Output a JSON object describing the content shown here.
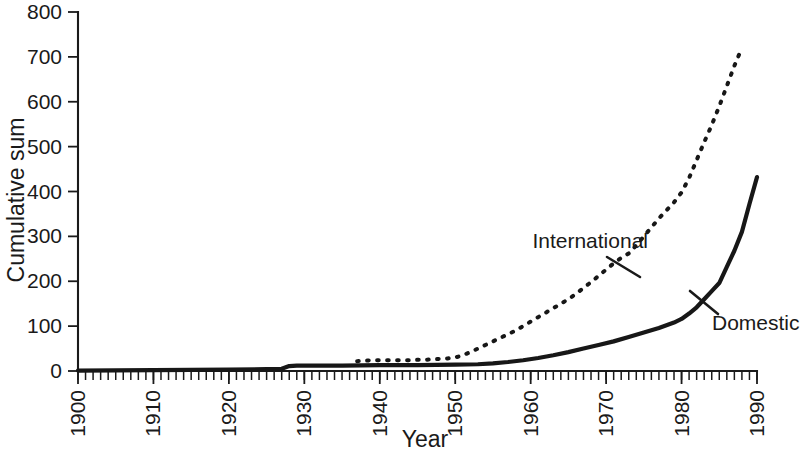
{
  "chart_data": {
    "type": "line",
    "title": "",
    "xlabel": "Year",
    "ylabel": "Cumulative sum",
    "xlim": [
      1900,
      1990
    ],
    "ylim": [
      0,
      800
    ],
    "grid": false,
    "legend_position": "inline-annotations",
    "x_ticks": [
      1900,
      1910,
      1920,
      1930,
      1940,
      1950,
      1960,
      1970,
      1980,
      1990
    ],
    "x_tick_labels": [
      "1900",
      "1910",
      "1920",
      "1930",
      "1940",
      "1950",
      "1960",
      "1970",
      "1980",
      "1990"
    ],
    "x_minor_tick_step": 1,
    "y_ticks": [
      0,
      100,
      200,
      300,
      400,
      500,
      600,
      700,
      800
    ],
    "y_tick_labels": [
      "0",
      "100",
      "200",
      "300",
      "400",
      "500",
      "600",
      "700",
      "800"
    ],
    "series": [
      {
        "name": "International",
        "style": "dotted",
        "label_text": "International",
        "x": [
          1937,
          1938,
          1939,
          1940,
          1941,
          1942,
          1943,
          1944,
          1945,
          1946,
          1947,
          1948,
          1949,
          1950,
          1951,
          1952,
          1953,
          1954,
          1955,
          1956,
          1957,
          1958,
          1959,
          1960,
          1961,
          1962,
          1963,
          1964,
          1965,
          1966,
          1967,
          1968,
          1969,
          1970,
          1971,
          1972,
          1973,
          1974,
          1975,
          1976,
          1977,
          1978,
          1979,
          1980,
          1981,
          1982,
          1983,
          1984,
          1985,
          1986,
          1987,
          1988
        ],
        "values": [
          22,
          23,
          24,
          24,
          24,
          24,
          24,
          24,
          25,
          25,
          26,
          27,
          28,
          30,
          35,
          42,
          50,
          58,
          66,
          74,
          82,
          90,
          100,
          110,
          120,
          130,
          140,
          150,
          160,
          172,
          185,
          198,
          212,
          226,
          240,
          252,
          262,
          280,
          300,
          320,
          340,
          358,
          376,
          398,
          430,
          470,
          510,
          548,
          590,
          635,
          680,
          720
        ]
      },
      {
        "name": "Domestic",
        "style": "solid",
        "label_text": "Domestic",
        "x": [
          1900,
          1910,
          1920,
          1925,
          1927,
          1928,
          1929,
          1930,
          1935,
          1940,
          1945,
          1950,
          1953,
          1955,
          1957,
          1959,
          1961,
          1963,
          1965,
          1967,
          1969,
          1971,
          1973,
          1975,
          1977,
          1979,
          1980,
          1981,
          1982,
          1983,
          1984,
          1985,
          1986,
          1987,
          1988,
          1989,
          1990
        ],
        "values": [
          1,
          2,
          3,
          4,
          5,
          11,
          12,
          12,
          12,
          13,
          13,
          14,
          15,
          17,
          20,
          24,
          29,
          35,
          42,
          50,
          58,
          66,
          76,
          86,
          96,
          108,
          116,
          128,
          142,
          160,
          178,
          196,
          232,
          268,
          310,
          372,
          432
        ]
      }
    ],
    "annotations": [
      {
        "name": "international-label",
        "text": "International",
        "x_px": 528,
        "y_px": 248
      },
      {
        "name": "domestic-label",
        "text": "Domestic",
        "x_px": 712,
        "y_px": 330
      }
    ]
  },
  "colors": {
    "ink": "#171717",
    "background": "#ffffff"
  }
}
